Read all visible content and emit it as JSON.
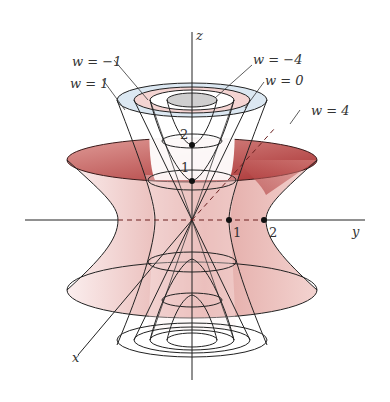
{
  "figure": {
    "axes": {
      "x_label": "x",
      "y_label": "y",
      "z_label": "z"
    },
    "tick_labels": {
      "y_1": "1",
      "y_2": "2",
      "z_1": "1",
      "z_2": "2"
    },
    "level_labels": [
      {
        "id": "wm1",
        "text": "w = −1"
      },
      {
        "id": "w1",
        "text": "w = 1"
      },
      {
        "id": "wm4",
        "text": "w = −4"
      },
      {
        "id": "w0",
        "text": "w = 0"
      },
      {
        "id": "w4",
        "text": "w = 4"
      }
    ],
    "colors": {
      "hyperboloid_dark": "#b0393a",
      "hyperboloid_light": "#f3d6d4",
      "cap_blue": "#dce8f2",
      "cap_pink": "#f4d4d2",
      "cap_gray": "#cfcfcf",
      "line": "#222222"
    }
  }
}
